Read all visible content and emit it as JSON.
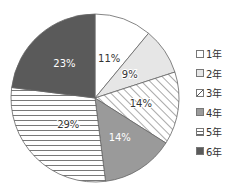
{
  "chart_data": {
    "type": "pie",
    "title": "",
    "start_angle": "12 o'clock",
    "direction": "clockwise",
    "categories": [
      "1年",
      "2年",
      "3年",
      "4年",
      "5年",
      "6年"
    ],
    "values": [
      11,
      9,
      14,
      14,
      29,
      23
    ],
    "labels": [
      "11%",
      "9%",
      "14%",
      "14%",
      "29%",
      "23%"
    ],
    "fills": [
      {
        "pattern": "solid",
        "color": "#ffffff"
      },
      {
        "pattern": "solid",
        "color": "#e6e6e6"
      },
      {
        "pattern": "diagonal",
        "color": "#ffffff"
      },
      {
        "pattern": "solid",
        "color": "#9a9a9a"
      },
      {
        "pattern": "horizontal",
        "color": "#ffffff"
      },
      {
        "pattern": "solid",
        "color": "#5a5a5a"
      }
    ],
    "label_colors": [
      "#333333",
      "#333333",
      "#333333",
      "#ffffff",
      "#333333",
      "#ffffff"
    ],
    "legend_position": "right"
  },
  "legend": {
    "items": [
      {
        "label": "1年"
      },
      {
        "label": "2年"
      },
      {
        "label": "3年"
      },
      {
        "label": "4年"
      },
      {
        "label": "5年"
      },
      {
        "label": "6年"
      }
    ]
  }
}
